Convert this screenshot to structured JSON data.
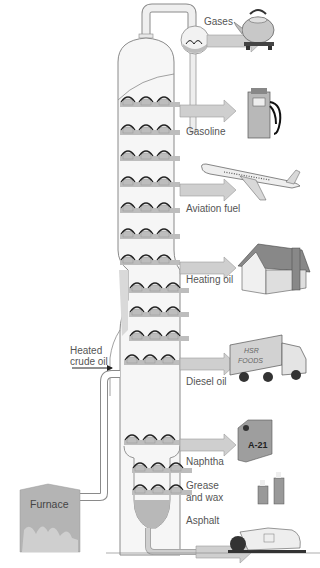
{
  "diagram": {
    "colors": {
      "column_fill": "#f6f6f6",
      "outline": "#8a8a8a",
      "tray": "#bdbdbd",
      "arrow": "#c9c9c9",
      "furnace": "#b4b4b4",
      "residue": "#b8b8b8"
    },
    "input": {
      "label_line1": "Heated",
      "label_line2": "crude oil"
    },
    "furnace": {
      "label": "Furnace"
    },
    "products": [
      {
        "label": "Gases",
        "icon": "kettle-icon"
      },
      {
        "label": "Gasoline",
        "icon": "fuel-pump-icon"
      },
      {
        "label": "Aviation fuel",
        "icon": "airplane-icon"
      },
      {
        "label": "Heating oil",
        "icon": "house-icon"
      },
      {
        "label": "Diesel oil",
        "icon": "truck-icon"
      },
      {
        "label": "Naphtha",
        "icon": "jerrycan-icon"
      },
      {
        "label_line1": "Grease",
        "label_line2": "and wax",
        "icon": "candles-icon"
      },
      {
        "label": "Asphalt",
        "icon": "road-roller-icon"
      }
    ],
    "icon_text": {
      "truck_line1": "HSR",
      "truck_line2": "FOODS",
      "can_label": "A-21"
    }
  }
}
